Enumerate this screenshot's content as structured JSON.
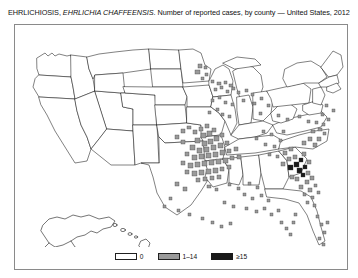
{
  "figure": {
    "title_prefix": "EHRLICHIOSIS, ",
    "title_species": "EHRLICHIA CHAFFEENSIS",
    "title_suffix": ". Number of reported cases, by county — United States, 2012"
  },
  "legend": {
    "position": "bottom-center",
    "entries": [
      {
        "label": "0",
        "color": "#ffffff",
        "border": "#202020"
      },
      {
        "label": "1–14",
        "color": "#9a9a9a",
        "border": "#202020"
      },
      {
        "label": "≥15",
        "color": "#1a1a1a",
        "border": "#1a1a1a"
      }
    ]
  },
  "chart_data": {
    "type": "heatmap",
    "title": "EHRLICHIOSIS, EHRLICHIA CHAFFEENSIS. Number of reported cases, by county — United States, 2012",
    "subtitle": "",
    "xlabel": "",
    "ylabel": "",
    "map_type": "choropleth-county",
    "region": "United States",
    "year": 2012,
    "disease": "Ehrlichiosis (Ehrlichia chaffeensis)",
    "measure": "Number of reported cases, by county",
    "insets": [
      "Alaska",
      "Hawaii"
    ],
    "grid": false,
    "legend_position": "bottom-center",
    "bins": [
      {
        "label": "0",
        "min": 0,
        "max": 0,
        "color": "#ffffff"
      },
      {
        "label": "1–14",
        "min": 1,
        "max": 14,
        "color": "#9a9a9a"
      },
      {
        "label": "≥15",
        "min": 15,
        "max": null,
        "color": "#1a1a1a"
      }
    ],
    "cluster_regions": [
      {
        "name": "Ozarks (Missouri / Arkansas / Oklahoma)",
        "density": "high"
      },
      {
        "name": "Mid-Atlantic coast (Virginia / Maryland / Delaware / New Jersey / New York)",
        "density": "high"
      },
      {
        "name": "Upper Midwest (Minnesota / Wisconsin)",
        "density": "scattered"
      },
      {
        "name": "Southeast (Florida / Georgia / Alabama / Tennessee)",
        "density": "scattered"
      },
      {
        "name": "New England (Connecticut / Rhode Island / Massachusetts)",
        "density": "moderate"
      },
      {
        "name": "Western United States",
        "density": "none"
      }
    ],
    "markers": [
      {
        "x": 183,
        "y": 39,
        "w": 4,
        "h": 4,
        "v": 1
      },
      {
        "x": 189,
        "y": 41,
        "w": 3,
        "h": 3,
        "v": 1
      },
      {
        "x": 180,
        "y": 45,
        "w": 5,
        "h": 4,
        "v": 1
      },
      {
        "x": 190,
        "y": 48,
        "w": 3,
        "h": 3,
        "v": 1
      },
      {
        "x": 186,
        "y": 52,
        "w": 3,
        "h": 3,
        "v": 1
      },
      {
        "x": 196,
        "y": 55,
        "w": 3,
        "h": 3,
        "v": 1
      },
      {
        "x": 202,
        "y": 57,
        "w": 4,
        "h": 3,
        "v": 1
      },
      {
        "x": 209,
        "y": 56,
        "w": 3,
        "h": 3,
        "v": 1
      },
      {
        "x": 214,
        "y": 59,
        "w": 4,
        "h": 3,
        "v": 1
      },
      {
        "x": 205,
        "y": 61,
        "w": 3,
        "h": 3,
        "v": 1
      },
      {
        "x": 199,
        "y": 63,
        "w": 3,
        "h": 3,
        "v": 1
      },
      {
        "x": 211,
        "y": 65,
        "w": 3,
        "h": 3,
        "v": 1
      },
      {
        "x": 217,
        "y": 62,
        "w": 3,
        "h": 3,
        "v": 1
      },
      {
        "x": 222,
        "y": 66,
        "w": 3,
        "h": 3,
        "v": 1
      },
      {
        "x": 230,
        "y": 64,
        "w": 3,
        "h": 3,
        "v": 1
      },
      {
        "x": 236,
        "y": 68,
        "w": 3,
        "h": 3,
        "v": 1
      },
      {
        "x": 203,
        "y": 71,
        "w": 3,
        "h": 3,
        "v": 1
      },
      {
        "x": 196,
        "y": 74,
        "w": 3,
        "h": 3,
        "v": 1
      },
      {
        "x": 209,
        "y": 76,
        "w": 3,
        "h": 3,
        "v": 1
      },
      {
        "x": 216,
        "y": 78,
        "w": 3,
        "h": 3,
        "v": 1
      },
      {
        "x": 227,
        "y": 74,
        "w": 3,
        "h": 3,
        "v": 1
      },
      {
        "x": 238,
        "y": 77,
        "w": 3,
        "h": 3,
        "v": 1
      },
      {
        "x": 245,
        "y": 72,
        "w": 3,
        "h": 3,
        "v": 1
      },
      {
        "x": 252,
        "y": 79,
        "w": 3,
        "h": 3,
        "v": 1
      },
      {
        "x": 201,
        "y": 83,
        "w": 3,
        "h": 3,
        "v": 1
      },
      {
        "x": 193,
        "y": 86,
        "w": 3,
        "h": 3,
        "v": 1
      },
      {
        "x": 206,
        "y": 88,
        "w": 3,
        "h": 3,
        "v": 1
      },
      {
        "x": 213,
        "y": 90,
        "w": 3,
        "h": 3,
        "v": 1
      },
      {
        "x": 244,
        "y": 87,
        "w": 3,
        "h": 3,
        "v": 1
      },
      {
        "x": 262,
        "y": 89,
        "w": 3,
        "h": 3,
        "v": 1
      },
      {
        "x": 166,
        "y": 104,
        "w": 4,
        "h": 4,
        "v": 1
      },
      {
        "x": 172,
        "y": 101,
        "w": 4,
        "h": 3,
        "v": 1
      },
      {
        "x": 160,
        "y": 110,
        "w": 4,
        "h": 4,
        "v": 1
      },
      {
        "x": 166,
        "y": 115,
        "w": 4,
        "h": 4,
        "v": 1
      },
      {
        "x": 178,
        "y": 105,
        "w": 4,
        "h": 4,
        "v": 2
      },
      {
        "x": 184,
        "y": 102,
        "w": 4,
        "h": 4,
        "v": 2
      },
      {
        "x": 190,
        "y": 99,
        "w": 4,
        "h": 4,
        "v": 2
      },
      {
        "x": 186,
        "y": 108,
        "w": 5,
        "h": 5,
        "v": 2
      },
      {
        "x": 192,
        "y": 106,
        "w": 5,
        "h": 5,
        "v": 2
      },
      {
        "x": 197,
        "y": 103,
        "w": 4,
        "h": 4,
        "v": 2
      },
      {
        "x": 180,
        "y": 113,
        "w": 5,
        "h": 5,
        "v": 2
      },
      {
        "x": 187,
        "y": 116,
        "w": 5,
        "h": 5,
        "v": 2
      },
      {
        "x": 193,
        "y": 114,
        "w": 5,
        "h": 5,
        "v": 2
      },
      {
        "x": 199,
        "y": 111,
        "w": 5,
        "h": 5,
        "v": 2
      },
      {
        "x": 205,
        "y": 108,
        "w": 4,
        "h": 4,
        "v": 2
      },
      {
        "x": 175,
        "y": 120,
        "w": 5,
        "h": 5,
        "v": 2
      },
      {
        "x": 182,
        "y": 123,
        "w": 5,
        "h": 5,
        "v": 2
      },
      {
        "x": 189,
        "y": 122,
        "w": 5,
        "h": 5,
        "v": 2
      },
      {
        "x": 196,
        "y": 120,
        "w": 5,
        "h": 5,
        "v": 2
      },
      {
        "x": 203,
        "y": 118,
        "w": 5,
        "h": 5,
        "v": 2
      },
      {
        "x": 210,
        "y": 116,
        "w": 4,
        "h": 4,
        "v": 2
      },
      {
        "x": 170,
        "y": 127,
        "w": 4,
        "h": 4,
        "v": 2
      },
      {
        "x": 177,
        "y": 130,
        "w": 5,
        "h": 5,
        "v": 2
      },
      {
        "x": 184,
        "y": 129,
        "w": 5,
        "h": 5,
        "v": 2
      },
      {
        "x": 191,
        "y": 128,
        "w": 5,
        "h": 5,
        "v": 2
      },
      {
        "x": 198,
        "y": 127,
        "w": 5,
        "h": 5,
        "v": 2
      },
      {
        "x": 205,
        "y": 125,
        "w": 5,
        "h": 5,
        "v": 2
      },
      {
        "x": 212,
        "y": 124,
        "w": 4,
        "h": 4,
        "v": 2
      },
      {
        "x": 219,
        "y": 122,
        "w": 4,
        "h": 4,
        "v": 2
      },
      {
        "x": 166,
        "y": 136,
        "w": 4,
        "h": 4,
        "v": 1
      },
      {
        "x": 173,
        "y": 138,
        "w": 5,
        "h": 5,
        "v": 2
      },
      {
        "x": 180,
        "y": 137,
        "w": 5,
        "h": 5,
        "v": 2
      },
      {
        "x": 187,
        "y": 136,
        "w": 5,
        "h": 5,
        "v": 2
      },
      {
        "x": 194,
        "y": 135,
        "w": 5,
        "h": 5,
        "v": 2
      },
      {
        "x": 201,
        "y": 134,
        "w": 5,
        "h": 5,
        "v": 2
      },
      {
        "x": 208,
        "y": 133,
        "w": 5,
        "h": 5,
        "v": 2
      },
      {
        "x": 215,
        "y": 131,
        "w": 4,
        "h": 4,
        "v": 2
      },
      {
        "x": 222,
        "y": 130,
        "w": 4,
        "h": 4,
        "v": 2
      },
      {
        "x": 170,
        "y": 145,
        "w": 4,
        "h": 4,
        "v": 1
      },
      {
        "x": 177,
        "y": 146,
        "w": 5,
        "h": 5,
        "v": 2
      },
      {
        "x": 184,
        "y": 145,
        "w": 5,
        "h": 5,
        "v": 2
      },
      {
        "x": 191,
        "y": 144,
        "w": 5,
        "h": 5,
        "v": 2
      },
      {
        "x": 198,
        "y": 143,
        "w": 5,
        "h": 5,
        "v": 2
      },
      {
        "x": 205,
        "y": 142,
        "w": 4,
        "h": 4,
        "v": 2
      },
      {
        "x": 212,
        "y": 140,
        "w": 4,
        "h": 4,
        "v": 1
      },
      {
        "x": 181,
        "y": 153,
        "w": 4,
        "h": 4,
        "v": 1
      },
      {
        "x": 188,
        "y": 152,
        "w": 4,
        "h": 4,
        "v": 1
      },
      {
        "x": 195,
        "y": 151,
        "w": 4,
        "h": 4,
        "v": 1
      },
      {
        "x": 202,
        "y": 150,
        "w": 4,
        "h": 4,
        "v": 1
      },
      {
        "x": 160,
        "y": 157,
        "w": 4,
        "h": 4,
        "v": 1
      },
      {
        "x": 168,
        "y": 162,
        "w": 4,
        "h": 4,
        "v": 1
      },
      {
        "x": 192,
        "y": 160,
        "w": 4,
        "h": 3,
        "v": 1
      },
      {
        "x": 200,
        "y": 163,
        "w": 3,
        "h": 3,
        "v": 1
      },
      {
        "x": 213,
        "y": 158,
        "w": 3,
        "h": 3,
        "v": 1
      },
      {
        "x": 222,
        "y": 162,
        "w": 3,
        "h": 3,
        "v": 1
      },
      {
        "x": 233,
        "y": 157,
        "w": 3,
        "h": 3,
        "v": 1
      },
      {
        "x": 241,
        "y": 161,
        "w": 3,
        "h": 3,
        "v": 1
      },
      {
        "x": 228,
        "y": 168,
        "w": 3,
        "h": 3,
        "v": 1
      },
      {
        "x": 236,
        "y": 172,
        "w": 3,
        "h": 3,
        "v": 1
      },
      {
        "x": 245,
        "y": 169,
        "w": 3,
        "h": 3,
        "v": 1
      },
      {
        "x": 252,
        "y": 174,
        "w": 3,
        "h": 3,
        "v": 1
      },
      {
        "x": 208,
        "y": 176,
        "w": 3,
        "h": 3,
        "v": 1
      },
      {
        "x": 217,
        "y": 180,
        "w": 3,
        "h": 3,
        "v": 1
      },
      {
        "x": 230,
        "y": 182,
        "w": 3,
        "h": 3,
        "v": 1
      },
      {
        "x": 240,
        "y": 185,
        "w": 3,
        "h": 3,
        "v": 1
      },
      {
        "x": 248,
        "y": 182,
        "w": 3,
        "h": 3,
        "v": 1
      },
      {
        "x": 255,
        "y": 188,
        "w": 3,
        "h": 3,
        "v": 1
      },
      {
        "x": 262,
        "y": 184,
        "w": 3,
        "h": 3,
        "v": 1
      },
      {
        "x": 265,
        "y": 196,
        "w": 3,
        "h": 3,
        "v": 1
      },
      {
        "x": 270,
        "y": 202,
        "w": 3,
        "h": 3,
        "v": 1
      },
      {
        "x": 274,
        "y": 208,
        "w": 3,
        "h": 3,
        "v": 1
      },
      {
        "x": 277,
        "y": 196,
        "w": 3,
        "h": 3,
        "v": 1
      },
      {
        "x": 279,
        "y": 188,
        "w": 3,
        "h": 3,
        "v": 1
      },
      {
        "x": 247,
        "y": 105,
        "w": 3,
        "h": 3,
        "v": 1
      },
      {
        "x": 255,
        "y": 108,
        "w": 3,
        "h": 3,
        "v": 1
      },
      {
        "x": 240,
        "y": 112,
        "w": 3,
        "h": 3,
        "v": 1
      },
      {
        "x": 249,
        "y": 118,
        "w": 3,
        "h": 3,
        "v": 1
      },
      {
        "x": 258,
        "y": 120,
        "w": 3,
        "h": 3,
        "v": 1
      },
      {
        "x": 264,
        "y": 114,
        "w": 3,
        "h": 3,
        "v": 1
      },
      {
        "x": 267,
        "y": 105,
        "w": 3,
        "h": 3,
        "v": 1
      },
      {
        "x": 253,
        "y": 128,
        "w": 3,
        "h": 3,
        "v": 1
      },
      {
        "x": 261,
        "y": 130,
        "w": 3,
        "h": 3,
        "v": 1
      },
      {
        "x": 268,
        "y": 126,
        "w": 4,
        "h": 4,
        "v": 2
      },
      {
        "x": 274,
        "y": 122,
        "w": 4,
        "h": 4,
        "v": 2
      },
      {
        "x": 272,
        "y": 132,
        "w": 4,
        "h": 4,
        "v": 2
      },
      {
        "x": 278,
        "y": 130,
        "w": 4,
        "h": 4,
        "v": 2
      },
      {
        "x": 266,
        "y": 137,
        "w": 4,
        "h": 4,
        "v": 2
      },
      {
        "x": 273,
        "y": 140,
        "w": 5,
        "h": 5,
        "v": 3
      },
      {
        "x": 279,
        "y": 137,
        "w": 5,
        "h": 5,
        "v": 3
      },
      {
        "x": 284,
        "y": 133,
        "w": 4,
        "h": 4,
        "v": 3
      },
      {
        "x": 287,
        "y": 127,
        "w": 4,
        "h": 4,
        "v": 2
      },
      {
        "x": 282,
        "y": 143,
        "w": 5,
        "h": 5,
        "v": 3
      },
      {
        "x": 288,
        "y": 140,
        "w": 4,
        "h": 4,
        "v": 3
      },
      {
        "x": 292,
        "y": 135,
        "w": 4,
        "h": 4,
        "v": 2
      },
      {
        "x": 286,
        "y": 148,
        "w": 4,
        "h": 4,
        "v": 3
      },
      {
        "x": 291,
        "y": 146,
        "w": 4,
        "h": 4,
        "v": 2
      },
      {
        "x": 280,
        "y": 152,
        "w": 4,
        "h": 4,
        "v": 2
      },
      {
        "x": 275,
        "y": 150,
        "w": 4,
        "h": 4,
        "v": 2
      },
      {
        "x": 290,
        "y": 155,
        "w": 4,
        "h": 4,
        "v": 2
      },
      {
        "x": 295,
        "y": 151,
        "w": 4,
        "h": 4,
        "v": 2
      },
      {
        "x": 284,
        "y": 160,
        "w": 4,
        "h": 4,
        "v": 2
      },
      {
        "x": 293,
        "y": 163,
        "w": 4,
        "h": 4,
        "v": 2
      },
      {
        "x": 299,
        "y": 159,
        "w": 3,
        "h": 3,
        "v": 2
      },
      {
        "x": 288,
        "y": 168,
        "w": 3,
        "h": 3,
        "v": 1
      },
      {
        "x": 296,
        "y": 171,
        "w": 3,
        "h": 3,
        "v": 1
      },
      {
        "x": 302,
        "y": 166,
        "w": 3,
        "h": 3,
        "v": 1
      },
      {
        "x": 291,
        "y": 176,
        "w": 3,
        "h": 3,
        "v": 1
      },
      {
        "x": 298,
        "y": 179,
        "w": 3,
        "h": 3,
        "v": 1
      },
      {
        "x": 287,
        "y": 116,
        "w": 4,
        "h": 4,
        "v": 2
      },
      {
        "x": 293,
        "y": 112,
        "w": 4,
        "h": 4,
        "v": 2
      },
      {
        "x": 298,
        "y": 118,
        "w": 4,
        "h": 4,
        "v": 2
      },
      {
        "x": 302,
        "y": 112,
        "w": 4,
        "h": 4,
        "v": 2
      },
      {
        "x": 296,
        "y": 105,
        "w": 4,
        "h": 3,
        "v": 2
      },
      {
        "x": 303,
        "y": 103,
        "w": 4,
        "h": 3,
        "v": 2
      },
      {
        "x": 308,
        "y": 107,
        "w": 3,
        "h": 3,
        "v": 2
      },
      {
        "x": 300,
        "y": 96,
        "w": 3,
        "h": 3,
        "v": 1
      },
      {
        "x": 307,
        "y": 98,
        "w": 3,
        "h": 3,
        "v": 1
      },
      {
        "x": 312,
        "y": 93,
        "w": 3,
        "h": 3,
        "v": 1
      },
      {
        "x": 306,
        "y": 88,
        "w": 3,
        "h": 3,
        "v": 1
      },
      {
        "x": 292,
        "y": 95,
        "w": 3,
        "h": 3,
        "v": 1
      },
      {
        "x": 283,
        "y": 90,
        "w": 3,
        "h": 3,
        "v": 1
      },
      {
        "x": 271,
        "y": 93,
        "w": 3,
        "h": 3,
        "v": 1
      },
      {
        "x": 317,
        "y": 84,
        "w": 3,
        "h": 3,
        "v": 1
      },
      {
        "x": 310,
        "y": 79,
        "w": 3,
        "h": 3,
        "v": 1
      },
      {
        "x": 301,
        "y": 190,
        "w": 3,
        "h": 3,
        "v": 1
      },
      {
        "x": 305,
        "y": 198,
        "w": 3,
        "h": 3,
        "v": 1
      },
      {
        "x": 308,
        "y": 206,
        "w": 3,
        "h": 3,
        "v": 1
      },
      {
        "x": 311,
        "y": 196,
        "w": 3,
        "h": 3,
        "v": 1
      },
      {
        "x": 303,
        "y": 212,
        "w": 3,
        "h": 3,
        "v": 1
      },
      {
        "x": 307,
        "y": 218,
        "w": 3,
        "h": 3,
        "v": 1
      },
      {
        "x": 154,
        "y": 172,
        "w": 3,
        "h": 3,
        "v": 1
      },
      {
        "x": 148,
        "y": 180,
        "w": 3,
        "h": 3,
        "v": 1
      },
      {
        "x": 162,
        "y": 184,
        "w": 3,
        "h": 3,
        "v": 1
      },
      {
        "x": 173,
        "y": 188,
        "w": 3,
        "h": 3,
        "v": 1
      },
      {
        "x": 186,
        "y": 192,
        "w": 3,
        "h": 3,
        "v": 1
      },
      {
        "x": 196,
        "y": 196,
        "w": 3,
        "h": 3,
        "v": 1
      },
      {
        "x": 205,
        "y": 200,
        "w": 3,
        "h": 3,
        "v": 1
      },
      {
        "x": 214,
        "y": 197,
        "w": 3,
        "h": 3,
        "v": 1
      }
    ]
  }
}
